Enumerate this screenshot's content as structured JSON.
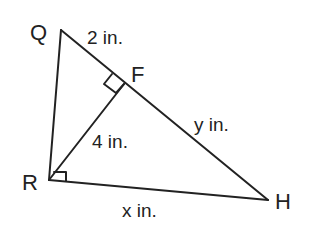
{
  "diagram": {
    "type": "right-triangle-with-altitude",
    "colors": {
      "stroke": "#222222",
      "background": "#ffffff",
      "text": "#222222"
    },
    "vertices": {
      "Q": {
        "label": "Q"
      },
      "F": {
        "label": "F"
      },
      "R": {
        "label": "R"
      },
      "H": {
        "label": "H"
      }
    },
    "measures": {
      "QF": "2 in.",
      "RF": "4 in.",
      "FH": "y in.",
      "RH": "x in."
    },
    "right_angles": [
      "R",
      "F"
    ]
  }
}
